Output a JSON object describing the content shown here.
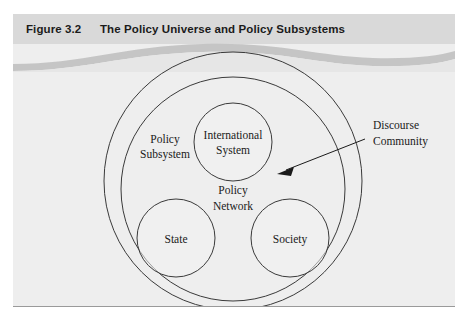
{
  "figure": {
    "number": "Figure 3.2",
    "title": "The Policy Universe and Policy Subsystems"
  },
  "diagram": {
    "type": "nested-venn",
    "outer_ring_label": "Discourse Community",
    "inner_ring_label_line1": "Policy",
    "inner_ring_label_line2": "Subsystem",
    "nodes": [
      {
        "id": "international-system",
        "line1": "International",
        "line2": "System"
      },
      {
        "id": "state",
        "line1": "State",
        "line2": ""
      },
      {
        "id": "society",
        "line1": "Society",
        "line2": ""
      },
      {
        "id": "policy-network",
        "line1": "Policy",
        "line2": "Network"
      }
    ],
    "callout": {
      "label_line1": "Discourse",
      "label_line2": "Community",
      "arrow": "points-left-down-into-ring"
    }
  },
  "colors": {
    "panel_background": "#eeeeee",
    "header_background": "#d9d9d9",
    "wave_light": "#e4e4e4",
    "wave_dark": "#bdbdbd",
    "stroke": "#3a3a3a",
    "text": "#1a1a1a",
    "rule": "#9a9a9a"
  }
}
